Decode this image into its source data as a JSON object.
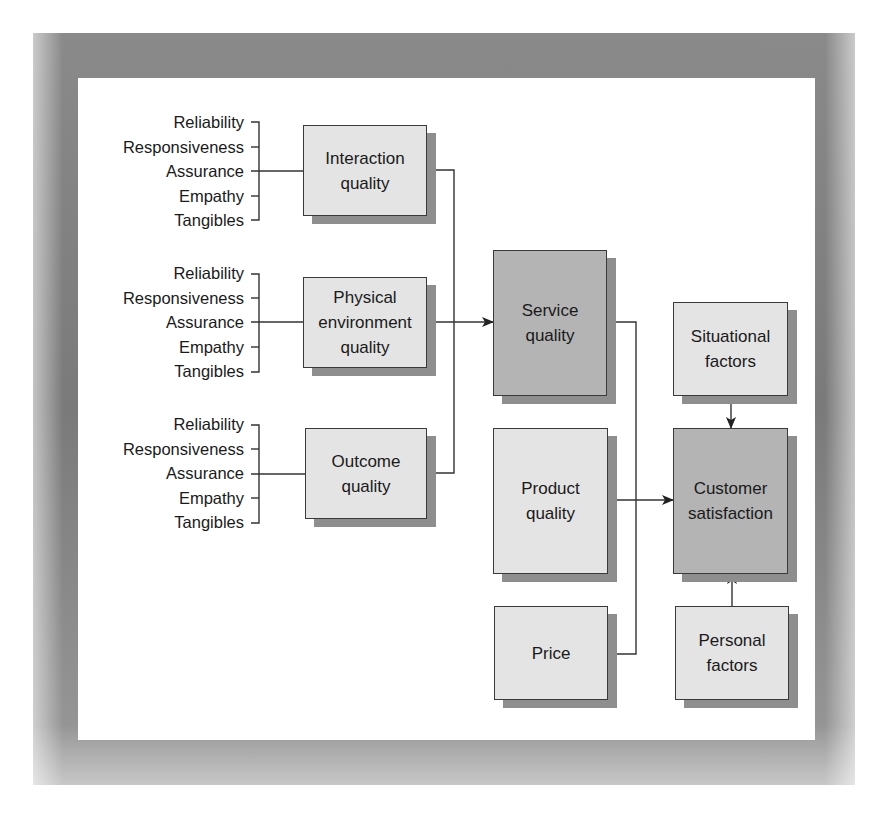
{
  "diagram": {
    "title": "",
    "dimension_groups": [
      {
        "id": "interaction",
        "items": [
          "Reliability",
          "Responsiveness",
          "Assurance",
          "Empathy",
          "Tangibles"
        ],
        "target": "Interaction\nquality"
      },
      {
        "id": "physical",
        "items": [
          "Reliability",
          "Responsiveness",
          "Assurance",
          "Empathy",
          "Tangibles"
        ],
        "target": "Physical\nenvironment\nquality"
      },
      {
        "id": "outcome",
        "items": [
          "Reliability",
          "Responsiveness",
          "Assurance",
          "Empathy",
          "Tangibles"
        ],
        "target": "Outcome\nquality"
      }
    ],
    "nodes": {
      "interaction_quality": "Interaction\nquality",
      "physical_environment_quality": "Physical\nenvironment\nquality",
      "outcome_quality": "Outcome\nquality",
      "service_quality": "Service\nquality",
      "product_quality": "Product\nquality",
      "price": "Price",
      "situational_factors": "Situational\nfactors",
      "customer_satisfaction": "Customer\nsatisfaction",
      "personal_factors": "Personal\nfactors"
    },
    "edges": [
      {
        "from": "Interaction quality",
        "to": "Service quality"
      },
      {
        "from": "Physical environment quality",
        "to": "Service quality"
      },
      {
        "from": "Outcome quality",
        "to": "Service quality"
      },
      {
        "from": "Service quality",
        "to": "Customer satisfaction"
      },
      {
        "from": "Product quality",
        "to": "Customer satisfaction"
      },
      {
        "from": "Price",
        "to": "Customer satisfaction"
      },
      {
        "from": "Situational factors",
        "to": "Customer satisfaction"
      },
      {
        "from": "Personal factors",
        "to": "Customer satisfaction"
      }
    ],
    "colors": {
      "light_box": "#e4e4e4",
      "dark_box": "#b4b4b4",
      "shadow": "#8e8e8e",
      "line": "#3a3a3a",
      "frame": "#808080"
    }
  }
}
